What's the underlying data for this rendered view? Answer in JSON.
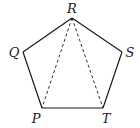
{
  "diagram": {
    "stroke_color": "#1a1a1a",
    "vertices": {
      "R": {
        "label": "R",
        "x": 72,
        "y": 18,
        "lx": 72,
        "ly": 13
      },
      "Q": {
        "label": "Q",
        "x": 23,
        "y": 52,
        "lx": 14,
        "ly": 57
      },
      "S": {
        "label": "S",
        "x": 122,
        "y": 52,
        "lx": 130,
        "ly": 57
      },
      "P": {
        "label": "P",
        "x": 42,
        "y": 108,
        "lx": 36,
        "ly": 123
      },
      "T": {
        "label": "T",
        "x": 103,
        "y": 108,
        "lx": 106,
        "ly": 123
      }
    },
    "edges_solid": [
      [
        "R",
        "S"
      ],
      [
        "S",
        "T"
      ],
      [
        "T",
        "P"
      ],
      [
        "P",
        "Q"
      ],
      [
        "Q",
        "R"
      ]
    ],
    "edges_dashed": [
      [
        "R",
        "P"
      ],
      [
        "R",
        "T"
      ]
    ]
  }
}
